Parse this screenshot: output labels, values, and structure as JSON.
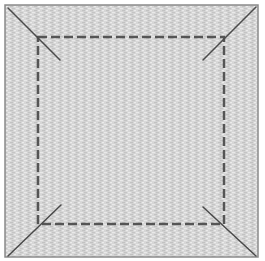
{
  "diagram": {
    "colors": {
      "background": "#ffffff",
      "fabric_base": "#d6d6d6",
      "fabric_brick_light": "#e6e6e6",
      "fabric_brick_dark": "#bdbdbd",
      "outline": "#8a8a8a",
      "stitch": "#555555",
      "diagonal": "#4a4a4a"
    },
    "outer_square": {
      "x": 5,
      "y": 5,
      "width": 253,
      "height": 252
    },
    "stitch_square": {
      "x": 38,
      "y": 37,
      "width": 186,
      "height": 187,
      "dash": "9 4",
      "stroke_width": 2.5
    },
    "corner_lines": [
      {
        "name": "top-left",
        "x1": 8,
        "y1": 8,
        "x2": 60,
        "y2": 60
      },
      {
        "name": "top-right",
        "x1": 256,
        "y1": 7,
        "x2": 203,
        "y2": 60
      },
      {
        "name": "bottom-left",
        "x1": 8,
        "y1": 256,
        "x2": 61,
        "y2": 205
      },
      {
        "name": "bottom-right",
        "x1": 256,
        "y1": 256,
        "x2": 203,
        "y2": 207
      }
    ]
  }
}
